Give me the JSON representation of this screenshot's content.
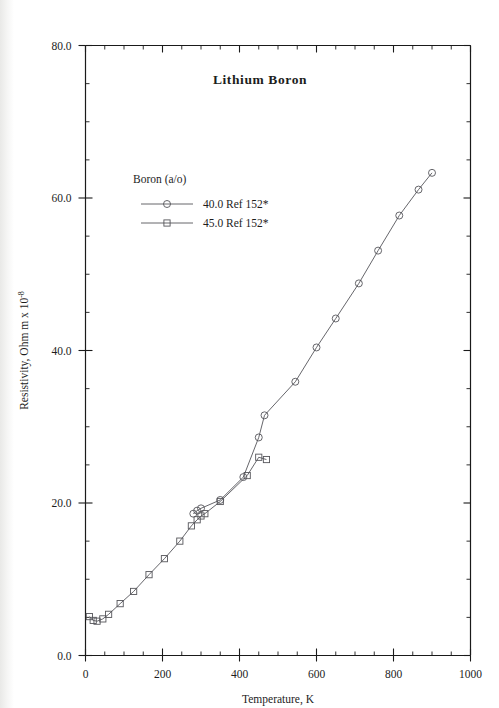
{
  "chart_data": {
    "type": "line",
    "title": "Lithium  Boron",
    "xlabel": "Temperature,  K",
    "ylabel": "Resistivity, Ohm m x 10",
    "ylabel_exponent": "-8",
    "xlim": [
      0,
      1000
    ],
    "ylim": [
      0,
      80
    ],
    "xticks": [
      0,
      200,
      400,
      600,
      800,
      1000
    ],
    "xtick_labels": [
      "0",
      "200",
      "400",
      "600",
      "800",
      "1000"
    ],
    "yticks": [
      0,
      20,
      40,
      60,
      80
    ],
    "ytick_labels": [
      "0.0",
      "20.0",
      "40.0",
      "60.0",
      "80.0"
    ],
    "x_minor_step": 50,
    "y_minor_step": 5,
    "grid": false,
    "legend_position": "upper-left-inside",
    "legend_title": "Boron (a/o)",
    "series": [
      {
        "name": "40.0 Ref 152*",
        "marker": "circle",
        "color": "#55555a",
        "points": [
          [
            280,
            18.6
          ],
          [
            290,
            19.0
          ],
          [
            300,
            19.3
          ],
          [
            350,
            20.4
          ],
          [
            410,
            23.4
          ],
          [
            450,
            28.6
          ],
          [
            465,
            31.5
          ],
          [
            545,
            35.9
          ],
          [
            600,
            40.4
          ],
          [
            650,
            44.2
          ],
          [
            710,
            48.8
          ],
          [
            760,
            53.1
          ],
          [
            815,
            57.7
          ],
          [
            865,
            61.1
          ],
          [
            900,
            63.3
          ]
        ]
      },
      {
        "name": "45.0 Ref 152*",
        "marker": "square",
        "color": "#55555a",
        "points": [
          [
            10,
            5.1
          ],
          [
            20,
            4.6
          ],
          [
            30,
            4.5
          ],
          [
            45,
            4.8
          ],
          [
            60,
            5.4
          ],
          [
            90,
            6.8
          ],
          [
            125,
            8.4
          ],
          [
            165,
            10.6
          ],
          [
            205,
            12.7
          ],
          [
            245,
            15.0
          ],
          [
            275,
            17.0
          ],
          [
            290,
            17.8
          ],
          [
            300,
            18.3
          ],
          [
            310,
            18.6
          ],
          [
            350,
            20.2
          ],
          [
            420,
            23.6
          ],
          [
            450,
            26.0
          ],
          [
            470,
            25.7
          ]
        ]
      }
    ]
  }
}
